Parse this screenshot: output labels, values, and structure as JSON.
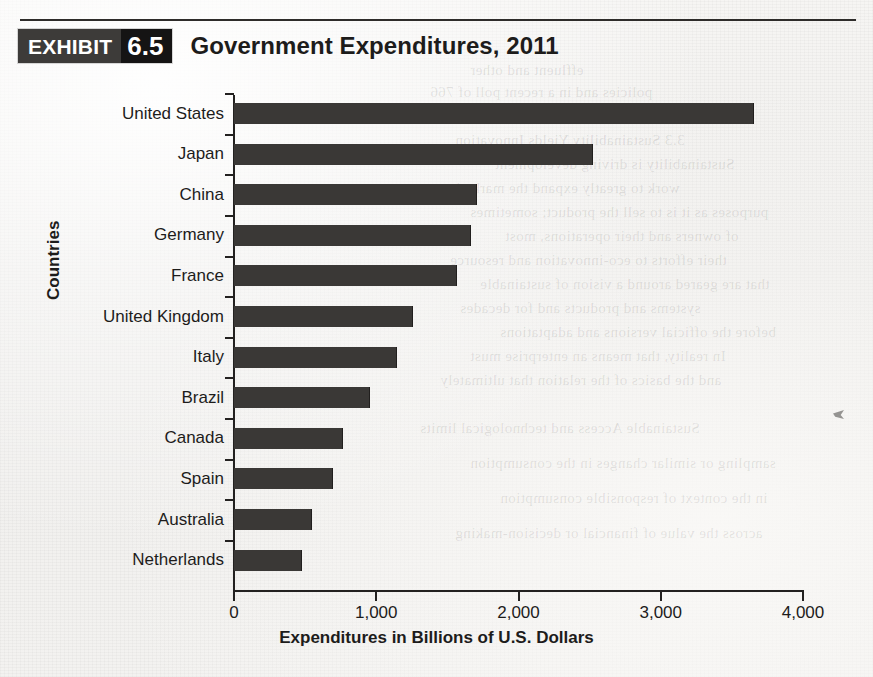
{
  "exhibit": {
    "badge_word": "EXHIBIT",
    "badge_number": "6.5",
    "title": "Government Expenditures, 2011"
  },
  "chart_data": {
    "type": "bar",
    "orientation": "horizontal",
    "title": "Government Expenditures, 2011",
    "xlabel": "Expenditures in Billions of U.S. Dollars",
    "ylabel": "Countries",
    "categories": [
      "United States",
      "Japan",
      "China",
      "Germany",
      "France",
      "United Kingdom",
      "Italy",
      "Brazil",
      "Canada",
      "Spain",
      "Australia",
      "Netherlands"
    ],
    "values": [
      3650,
      2520,
      1700,
      1660,
      1560,
      1250,
      1140,
      950,
      760,
      690,
      540,
      470
    ],
    "xlim": [
      0,
      4000
    ],
    "xticks": [
      0,
      1000,
      2000,
      3000,
      4000
    ],
    "xtick_labels": [
      "0",
      "1,000",
      "2,000",
      "3,000",
      "4,000"
    ],
    "grid": false,
    "legend": null,
    "bar_color": "#3a3836"
  },
  "ghost_text": [
    "effluent and other",
    "policies and in a recent poll of 766",
    "million that was recently introduced",
    "3.3 Sustainability Yields Innovation",
    "Sustainability is driving development",
    "work to greatly expand the marketing",
    "purposes as it is to sell the product; sometimes",
    "of owners and their operations, most",
    "their efforts to eco-innovation and resource",
    "that are geared around a vision of sustainable",
    "systems and products and for decades",
    "before the official versions and adaptations",
    "In reality, that means an enterprise must",
    "and the basics of the relation that ultimately",
    "Sustainable Access and technological limits",
    "sampling or similar changes in the consumption",
    "in the context of responsible consumption",
    "across the value of financial or decision-making"
  ]
}
